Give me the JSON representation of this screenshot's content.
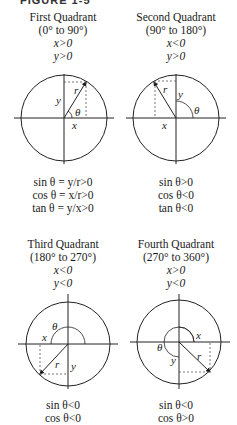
{
  "header": {
    "label": "FIGURE 1-5"
  },
  "quadrants": [
    {
      "title": "First Quadrant",
      "range": "(0° to 90°)",
      "x_cond": "x>0",
      "y_cond": "y>0",
      "labels": {
        "r": "r",
        "x": "x",
        "y": "y",
        "theta": "θ"
      },
      "results": [
        "sin θ = y/r>0",
        "cos θ = x/r>0",
        "tan θ = y/x>0"
      ]
    },
    {
      "title": "Second Quadrant",
      "range": "(90° to 180°)",
      "x_cond": "x<0",
      "y_cond": "y>0",
      "labels": {
        "r": "r",
        "x": "x",
        "y": "y",
        "theta": "θ"
      },
      "results": [
        "sin θ>0",
        "cos θ<0",
        "tan θ<0"
      ]
    },
    {
      "title": "Third Quadrant",
      "range": "(180° to 270°)",
      "x_cond": "x<0",
      "y_cond": "y<0",
      "labels": {
        "r": "r",
        "x": "x",
        "y": "y",
        "theta": "θ"
      },
      "results": [
        "sin θ<0",
        "cos θ<0"
      ]
    },
    {
      "title": "Fourth Quadrant",
      "range": "(270° to 360°)",
      "x_cond": "x>0",
      "y_cond": "y<0",
      "labels": {
        "r": "r",
        "x": "x",
        "y": "y",
        "theta": "θ"
      },
      "results": [
        "sin θ<0",
        "cos θ>0"
      ]
    }
  ]
}
